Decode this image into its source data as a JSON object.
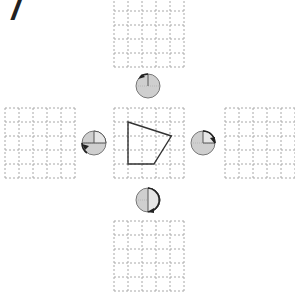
{
  "problem": {
    "number": "7"
  },
  "grids": [
    {
      "id": "top",
      "x": 114,
      "y": -3,
      "cols": 5,
      "rows": 5,
      "cell": 14
    },
    {
      "id": "left",
      "x": 5,
      "y": 108,
      "cols": 5,
      "rows": 5,
      "cell": 14
    },
    {
      "id": "center",
      "x": 114,
      "y": 108,
      "cols": 5,
      "rows": 5,
      "cell": 14
    },
    {
      "id": "right",
      "x": 225,
      "y": 108,
      "cols": 5,
      "rows": 5,
      "cell": 14
    },
    {
      "id": "bottom",
      "x": 114,
      "y": 221,
      "cols": 5,
      "rows": 5,
      "cell": 14
    }
  ],
  "shape": {
    "name": "quadrilateral",
    "points_grid_units": [
      [
        1,
        1
      ],
      [
        4.1,
        2
      ],
      [
        2.85,
        4
      ],
      [
        1,
        4
      ]
    ]
  },
  "dials": [
    {
      "id": "top",
      "cx": 148,
      "cy": 86,
      "r": 12,
      "rotation": "quarter-turn counterclockwise",
      "hand": "up"
    },
    {
      "id": "left",
      "cx": 94,
      "cy": 143,
      "r": 12,
      "rotation": "quarter-turn",
      "hand": "up-left"
    },
    {
      "id": "right",
      "cx": 203,
      "cy": 143,
      "r": 12,
      "rotation": "quarter-turn clockwise",
      "hand": "up-right"
    },
    {
      "id": "bottom",
      "cx": 148,
      "cy": 200,
      "r": 12,
      "rotation": "half-turn",
      "hand": "down"
    }
  ],
  "colors": {
    "grid_line": "#a8a8a8",
    "shape_stroke": "#333333",
    "dial_fill": "#cfcfcf",
    "dial_stroke": "#777777",
    "arrow": "#222222"
  }
}
